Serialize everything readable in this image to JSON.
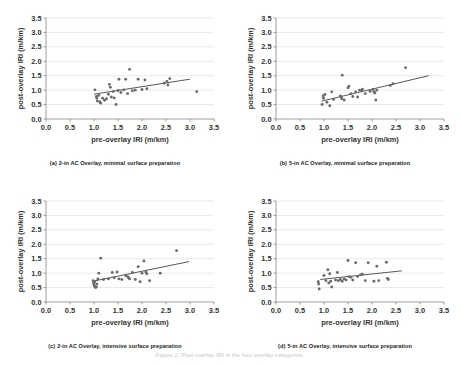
{
  "figure": {
    "caption": "Figure 2.  Post-overlay IRI in the four overlay categories."
  },
  "axes": {
    "xlabel": "pre-overlay IRI (m/km)",
    "ylabel": "post-overlay IRI (m/km)",
    "xticks": [
      "0.0",
      "0.5",
      "1.0",
      "1.5",
      "2.0",
      "2.5",
      "3.0",
      "3.5"
    ],
    "yticks": [
      "0.0",
      "0.5",
      "1.0",
      "1.5",
      "2.0",
      "2.5",
      "3.0",
      "3.5"
    ],
    "xlim": [
      0.0,
      3.5
    ],
    "ylim": [
      0.0,
      3.5
    ]
  },
  "panels": [
    {
      "tag": "(a)",
      "caption": "2-in AC Overlay, minimal surface preparation"
    },
    {
      "tag": "(b)",
      "caption": "5-in AC Overlay, minimal surface preparation"
    },
    {
      "tag": "(c)",
      "caption": "2-in AC Overlay, intensive surface preparation"
    },
    {
      "tag": "(d)",
      "caption": "5-in AC Overlay, intensive surface preparation"
    }
  ],
  "chart_data": [
    {
      "type": "scatter",
      "title": "(a) 2-in AC Overlay, minimal surface preparation",
      "xlabel": "pre-overlay IRI (m/km)",
      "ylabel": "post-overlay IRI (m/km)",
      "xlim": [
        0.0,
        3.5
      ],
      "ylim": [
        0.0,
        3.5
      ],
      "grid": true,
      "legend": "none",
      "marker_color": "#6b6b6b",
      "points": [
        [
          1.02,
          1.01
        ],
        [
          1.05,
          0.78
        ],
        [
          1.06,
          0.72
        ],
        [
          1.07,
          0.62
        ],
        [
          1.1,
          0.82
        ],
        [
          1.12,
          0.6
        ],
        [
          1.14,
          0.55
        ],
        [
          1.18,
          0.72
        ],
        [
          1.22,
          0.65
        ],
        [
          1.26,
          0.7
        ],
        [
          1.3,
          0.86
        ],
        [
          1.32,
          1.2
        ],
        [
          1.34,
          1.1
        ],
        [
          1.36,
          0.76
        ],
        [
          1.4,
          0.95
        ],
        [
          1.42,
          0.73
        ],
        [
          1.46,
          0.5
        ],
        [
          1.5,
          0.99
        ],
        [
          1.52,
          1.38
        ],
        [
          1.56,
          0.92
        ],
        [
          1.62,
          1.01
        ],
        [
          1.66,
          1.38
        ],
        [
          1.7,
          0.88
        ],
        [
          1.74,
          1.72
        ],
        [
          1.8,
          0.98
        ],
        [
          1.86,
          1.0
        ],
        [
          1.92,
          1.38
        ],
        [
          2.0,
          1.02
        ],
        [
          2.06,
          1.35
        ],
        [
          2.1,
          1.05
        ],
        [
          2.46,
          1.24
        ],
        [
          2.52,
          1.3
        ],
        [
          2.54,
          1.18
        ],
        [
          2.58,
          1.4
        ],
        [
          3.14,
          0.95
        ]
      ],
      "trendline": {
        "x": [
          1.0,
          3.0
        ],
        "y": [
          0.86,
          1.38
        ]
      }
    },
    {
      "type": "scatter",
      "title": "(b) 5-in AC Overlay, minimal surface preparation",
      "xlabel": "pre-overlay IRI (m/km)",
      "ylabel": "post-overlay IRI (m/km)",
      "xlim": [
        0.0,
        3.5
      ],
      "ylim": [
        0.0,
        3.5
      ],
      "grid": true,
      "legend": "none",
      "marker_color": "#6b6b6b",
      "points": [
        [
          0.96,
          0.5
        ],
        [
          0.98,
          0.8
        ],
        [
          0.99,
          0.72
        ],
        [
          1.02,
          0.85
        ],
        [
          1.06,
          0.58
        ],
        [
          1.12,
          0.46
        ],
        [
          1.16,
          0.94
        ],
        [
          1.2,
          0.68
        ],
        [
          1.34,
          0.8
        ],
        [
          1.36,
          0.76
        ],
        [
          1.37,
          0.7
        ],
        [
          1.38,
          1.52
        ],
        [
          1.42,
          0.66
        ],
        [
          1.5,
          1.08
        ],
        [
          1.52,
          1.14
        ],
        [
          1.56,
          0.88
        ],
        [
          1.6,
          0.78
        ],
        [
          1.66,
          0.94
        ],
        [
          1.7,
          0.76
        ],
        [
          1.74,
          1.0
        ],
        [
          1.78,
          0.98
        ],
        [
          1.8,
          1.03
        ],
        [
          1.86,
          0.88
        ],
        [
          1.96,
          0.96
        ],
        [
          2.02,
          1.02
        ],
        [
          2.04,
          0.94
        ],
        [
          2.06,
          0.9
        ],
        [
          2.08,
          0.66
        ],
        [
          2.1,
          1.0
        ],
        [
          2.38,
          1.16
        ],
        [
          2.44,
          1.22
        ],
        [
          2.7,
          1.78
        ]
      ],
      "trendline": {
        "x": [
          0.95,
          3.18
        ],
        "y": [
          0.62,
          1.5
        ]
      }
    },
    {
      "type": "scatter",
      "title": "(c) 2-in AC Overlay, intensive surface preparation",
      "xlabel": "pre-overlay IRI (m/km)",
      "ylabel": "post-overlay IRI (m/km)",
      "xlim": [
        0.0,
        3.5
      ],
      "ylim": [
        0.0,
        3.5
      ],
      "grid": true,
      "legend": "none",
      "marker_color": "#6b6b6b",
      "points": [
        [
          0.98,
          0.74
        ],
        [
          0.99,
          0.66
        ],
        [
          1.0,
          0.6
        ],
        [
          1.01,
          0.55
        ],
        [
          1.02,
          0.7
        ],
        [
          1.03,
          0.5
        ],
        [
          1.05,
          0.52
        ],
        [
          1.06,
          0.62
        ],
        [
          1.08,
          0.8
        ],
        [
          1.1,
          1.0
        ],
        [
          1.14,
          1.52
        ],
        [
          1.2,
          0.78
        ],
        [
          1.3,
          0.8
        ],
        [
          1.38,
          1.02
        ],
        [
          1.42,
          0.84
        ],
        [
          1.48,
          1.04
        ],
        [
          1.52,
          0.8
        ],
        [
          1.58,
          0.78
        ],
        [
          1.66,
          0.92
        ],
        [
          1.7,
          0.88
        ],
        [
          1.72,
          0.84
        ],
        [
          1.74,
          0.8
        ],
        [
          1.8,
          1.02
        ],
        [
          1.86,
          0.78
        ],
        [
          1.92,
          1.22
        ],
        [
          1.96,
          0.7
        ],
        [
          2.0,
          1.0
        ],
        [
          2.04,
          1.42
        ],
        [
          2.08,
          1.04
        ],
        [
          2.1,
          0.98
        ],
        [
          2.16,
          0.74
        ],
        [
          2.38,
          1.0
        ],
        [
          2.72,
          1.78
        ]
      ],
      "trendline": {
        "x": [
          0.98,
          2.98
        ],
        "y": [
          0.72,
          1.4
        ]
      }
    },
    {
      "type": "scatter",
      "title": "(d) 5-in AC Overlay, intensive surface preparation",
      "xlabel": "pre-overlay IRI (m/km)",
      "ylabel": "post-overlay IRI (m/km)",
      "xlim": [
        0.0,
        3.5
      ],
      "ylim": [
        0.0,
        3.5
      ],
      "grid": true,
      "legend": "none",
      "marker_color": "#6b6b6b",
      "points": [
        [
          0.88,
          0.7
        ],
        [
          0.89,
          0.62
        ],
        [
          0.9,
          0.45
        ],
        [
          1.0,
          0.92
        ],
        [
          1.04,
          0.74
        ],
        [
          1.08,
          1.12
        ],
        [
          1.1,
          0.66
        ],
        [
          1.12,
          0.98
        ],
        [
          1.14,
          0.72
        ],
        [
          1.16,
          0.52
        ],
        [
          1.24,
          0.76
        ],
        [
          1.28,
          1.02
        ],
        [
          1.3,
          0.74
        ],
        [
          1.34,
          0.78
        ],
        [
          1.38,
          0.72
        ],
        [
          1.42,
          0.8
        ],
        [
          1.46,
          0.76
        ],
        [
          1.5,
          1.44
        ],
        [
          1.52,
          0.88
        ],
        [
          1.56,
          0.86
        ],
        [
          1.6,
          0.76
        ],
        [
          1.66,
          1.36
        ],
        [
          1.7,
          0.88
        ],
        [
          1.76,
          0.94
        ],
        [
          1.8,
          0.96
        ],
        [
          1.86,
          0.74
        ],
        [
          1.92,
          1.36
        ],
        [
          2.04,
          0.72
        ],
        [
          2.1,
          1.24
        ],
        [
          2.14,
          0.74
        ],
        [
          2.3,
          1.38
        ],
        [
          2.32,
          0.82
        ],
        [
          2.34,
          0.78
        ]
      ],
      "trendline": {
        "x": [
          0.92,
          2.62
        ],
        "y": [
          0.78,
          1.08
        ]
      }
    }
  ]
}
